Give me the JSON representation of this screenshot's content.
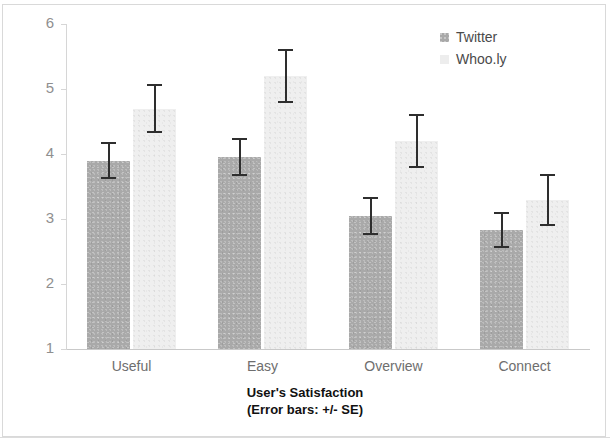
{
  "chart_data": {
    "type": "bar",
    "title": "",
    "xlabel": "User's Satisfaction",
    "xlabel_sub": "(Error bars: +/- SE)",
    "ylabel": "Mean",
    "ylim": [
      1,
      6
    ],
    "yticks": [
      6,
      5,
      4,
      3,
      2,
      1
    ],
    "grid": false,
    "legend_position": "top-right",
    "categories": [
      "Useful",
      "Easy",
      "Overview",
      "Connect"
    ],
    "series": [
      {
        "name": "Twitter",
        "color": "#a9a9a9",
        "values": [
          3.9,
          3.95,
          3.05,
          2.83
        ],
        "errors": [
          0.28,
          0.29,
          0.29,
          0.28
        ]
      },
      {
        "name": "Whoo.ly",
        "color": "#efefef",
        "values": [
          4.7,
          5.2,
          4.2,
          3.3
        ],
        "errors": [
          0.38,
          0.42,
          0.42,
          0.4
        ]
      }
    ]
  },
  "legend": {
    "items": [
      {
        "label": "Twitter",
        "swatch": "twitter-swatch"
      },
      {
        "label": "Whoo.ly",
        "swatch": "whooly-swatch"
      }
    ]
  },
  "axes": {
    "y_title": "Mean",
    "x_title": "User's Satisfaction",
    "x_subtitle": "(Error bars: +/- SE)",
    "y_tick_labels": [
      "6",
      "5",
      "4",
      "3",
      "2",
      "1"
    ],
    "x_tick_labels": [
      "Useful",
      "Easy",
      "Overview",
      "Connect"
    ]
  }
}
